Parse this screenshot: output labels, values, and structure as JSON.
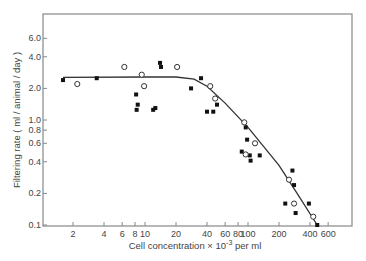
{
  "chart_data": {
    "type": "scatter",
    "title": "",
    "xlabel": "Cell concentration × 10⁻³ per ml",
    "xlabel_parts": {
      "prefix": "Cell concentration × 10",
      "exp": "-3",
      "suffix": " per ml"
    },
    "ylabel": "Filtering rate ( ml / animal / day )",
    "xscale": "log",
    "yscale": "log",
    "xlim": [
      1,
      800
    ],
    "ylim": [
      0.1,
      8.0
    ],
    "grid": false,
    "legend": null,
    "x_ticks": [
      2,
      4,
      6,
      8,
      10,
      20,
      40,
      60,
      80,
      100,
      200,
      400,
      600
    ],
    "x_tick_labels": [
      "2",
      "4",
      "6",
      "8",
      "10",
      "20",
      "40",
      "60",
      "80",
      "100",
      "200",
      "400",
      "600"
    ],
    "y_ticks": [
      0.1,
      0.2,
      0.4,
      0.6,
      0.8,
      1.0,
      2.0,
      4.0,
      6.0
    ],
    "y_tick_labels": [
      "0.1",
      "0.2",
      "0.4",
      "0.6",
      "0.8",
      "1.0",
      "2.0",
      "4.0",
      "6.0"
    ],
    "series": [
      {
        "name": "filled",
        "marker": "filled-square",
        "points": [
          [
            1.6,
            2.4
          ],
          [
            3.4,
            2.5
          ],
          [
            8.2,
            1.75
          ],
          [
            8.5,
            1.4
          ],
          [
            8.3,
            1.25
          ],
          [
            12.6,
            1.3
          ],
          [
            12.0,
            1.25
          ],
          [
            14.0,
            3.5
          ],
          [
            14.3,
            3.2
          ],
          [
            35,
            2.5
          ],
          [
            28,
            2.0
          ],
          [
            50,
            1.4
          ],
          [
            40,
            1.2
          ],
          [
            46,
            1.2
          ],
          [
            95,
            0.85
          ],
          [
            98,
            0.65
          ],
          [
            87,
            0.5
          ],
          [
            104,
            0.46
          ],
          [
            106,
            0.41
          ],
          [
            130,
            0.46
          ],
          [
            270,
            0.33
          ],
          [
            280,
            0.24
          ],
          [
            230,
            0.16
          ],
          [
            390,
            0.16
          ],
          [
            290,
            0.13
          ],
          [
            470,
            0.1
          ]
        ]
      },
      {
        "name": "open",
        "marker": "open-circle",
        "points": [
          [
            2.2,
            2.2
          ],
          [
            6.3,
            3.2
          ],
          [
            9.3,
            2.7
          ],
          [
            9.8,
            2.1
          ],
          [
            20.5,
            3.2
          ],
          [
            43,
            2.1
          ],
          [
            48,
            1.6
          ],
          [
            92,
            0.95
          ],
          [
            117,
            0.6
          ],
          [
            95,
            0.47
          ],
          [
            250,
            0.27
          ],
          [
            280,
            0.16
          ],
          [
            430,
            0.12
          ]
        ]
      },
      {
        "name": "fitted-curve",
        "marker": "line",
        "points": [
          [
            1.6,
            2.55
          ],
          [
            10,
            2.57
          ],
          [
            20,
            2.57
          ],
          [
            30,
            2.45
          ],
          [
            40,
            2.1
          ],
          [
            60,
            1.45
          ],
          [
            100,
            0.85
          ],
          [
            200,
            0.37
          ],
          [
            300,
            0.2
          ],
          [
            470,
            0.1
          ]
        ]
      }
    ]
  }
}
